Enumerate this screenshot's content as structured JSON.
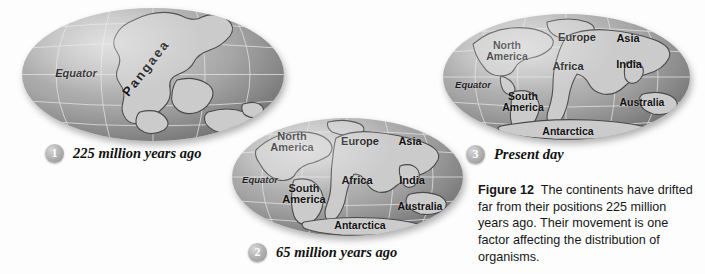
{
  "figure": {
    "caption_bold": "Figure 12",
    "caption_text": "The continents have drifted far from their positions 225 million years ago. Their movement is one factor affecting the distribution of organisms.",
    "background_color": "#fdfdfd",
    "land_color": "#cbcbcb",
    "ocean_color": "#a5a5a5",
    "graticule_color": "#e2e2e2",
    "label_color": "#111111"
  },
  "steps": [
    {
      "number": "1",
      "label": "225 million years ago"
    },
    {
      "number": "2",
      "label": "65 million years ago"
    },
    {
      "number": "3",
      "label": "Present day"
    }
  ],
  "globes": [
    {
      "id": "globe-pangaea",
      "step_number": "1",
      "step_label": "225 million years ago",
      "labels": [
        {
          "name": "equator",
          "text": "Equator"
        },
        {
          "name": "pangaea",
          "text": "Pangaea"
        }
      ]
    },
    {
      "id": "globe-65mya",
      "step_number": "2",
      "step_label": "65 million years ago",
      "labels": [
        {
          "name": "equator",
          "text": "Equator"
        },
        {
          "name": "north-america",
          "text": "North\nAmerica"
        },
        {
          "name": "south-america",
          "text": "South\nAmerica"
        },
        {
          "name": "europe",
          "text": "Europe"
        },
        {
          "name": "africa",
          "text": "Africa"
        },
        {
          "name": "asia",
          "text": "Asia"
        },
        {
          "name": "india",
          "text": "India"
        },
        {
          "name": "australia",
          "text": "Australia"
        },
        {
          "name": "antarctica",
          "text": "Antarctica"
        }
      ]
    },
    {
      "id": "globe-present",
      "step_number": "3",
      "step_label": "Present day",
      "labels": [
        {
          "name": "equator",
          "text": "Equator"
        },
        {
          "name": "north-america",
          "text": "North\nAmerica"
        },
        {
          "name": "south-america",
          "text": "South\nAmerica"
        },
        {
          "name": "europe",
          "text": "Europe"
        },
        {
          "name": "africa",
          "text": "Africa"
        },
        {
          "name": "asia",
          "text": "Asia"
        },
        {
          "name": "india",
          "text": "India"
        },
        {
          "name": "australia",
          "text": "Australia"
        },
        {
          "name": "antarctica",
          "text": "Antarctica"
        }
      ]
    }
  ]
}
